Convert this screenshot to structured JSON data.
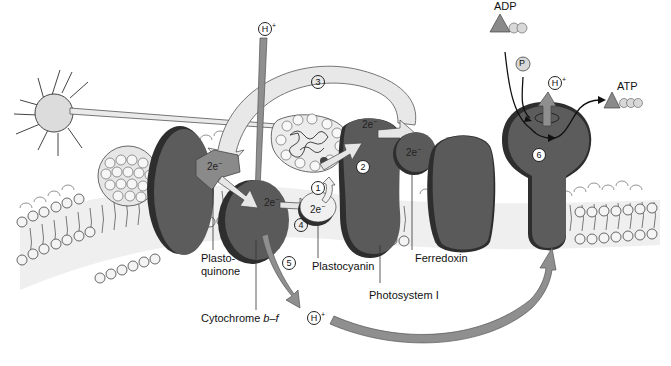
{
  "diagram": {
    "colors": {
      "background": "#ffffff",
      "membrane_bg": "#ececec",
      "protein_dark": "#5a5a5a",
      "protein_shadow": "#2e2e2e",
      "pq_carrier": "#8a8a8a",
      "light_arrow": "#e2e2e2",
      "proton_arrow": "#8f8f8f",
      "sun_fill": "#dcdcdc"
    },
    "labels": {
      "plastoquinone_line1": "Plasto-",
      "plastoquinone_line2": "quinone",
      "cytochrome_prefix": "Cytochrome ",
      "cytochrome_italic": "b–f",
      "plastocyanin": "Plastocyanin",
      "photosystem1": "Photosystem I",
      "ferredoxin": "Ferredoxin",
      "adp": "ADP",
      "atp": "ATP",
      "phosphate": "P"
    },
    "electrons": {
      "pq": "2e",
      "cyt": "2e",
      "pc": "2e",
      "ps1": "2e",
      "fd": "2e",
      "sup": "−"
    },
    "protons": {
      "top_symbol": "H",
      "top_charge": "+",
      "bottom_symbol": "H",
      "bottom_charge": "+",
      "atpase_symbol": "H",
      "atpase_charge": "+"
    },
    "steps": {
      "s1": "1",
      "s2": "2",
      "s3": "3",
      "s4": "4",
      "s5": "5",
      "s6": "6"
    }
  }
}
